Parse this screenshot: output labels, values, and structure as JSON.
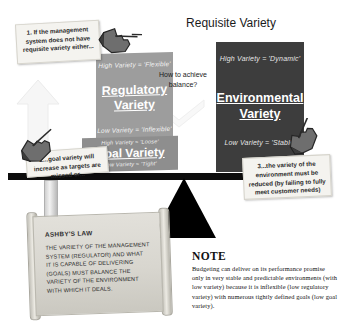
{
  "title": {
    "main": "Requisite Variety",
    "question": "How to achieve balance?"
  },
  "boxes": {
    "regulatory": {
      "high": "High Variety = 'Flexible'",
      "label": "Regulatory Variety",
      "low": "Low Variety = 'Inflexible'",
      "color": "#9d9d9d"
    },
    "goal": {
      "high": "High Variety = 'Loose'",
      "label": "Goal Variety",
      "low": "Low Variety = 'Tight'",
      "color": "#8e8e8e"
    },
    "environmental": {
      "high": "High Variety = 'Dynamic'",
      "label": "Environmental Variety",
      "low": "Low Variety = 'Stable'",
      "color": "#3d3d3d"
    }
  },
  "notes": {
    "note1": "1. If the management system does not have requisite variety either...",
    "note2": "2...goal variety will increase as targets are missed or...",
    "note3": "3...the variety of the environment must be reduced (by failing to fully meet customer needs)"
  },
  "scroll": {
    "heading": "ASHBY'S LAW",
    "body": "THE VARIETY OF THE MANAGEMENT SYSTEM (REGULATOR) AND WHAT IT IS CAPABLE OF DELIVERING (GOALS) MUST BALANCE THE VARIETY OF THE ENVIRONMENT WITH WHICH IT DEALS."
  },
  "note_block": {
    "heading": "NOTE",
    "body": "Budgeting can deliver on its performance promise only in very stable and predictable environments (with low variety) because it is inflexible (low regulatory variety) with numerous tightly defined goals (low goal variety)."
  },
  "icons": {
    "hand_top": "pointing-hand-icon",
    "hand_left": "pointing-hand-icon",
    "hand_right": "pointing-hand-icon",
    "fulcrum": "triangle-fulcrum-icon",
    "arrow_up": "arrow-up-icon",
    "arrow_down": "arrow-down-icon"
  }
}
